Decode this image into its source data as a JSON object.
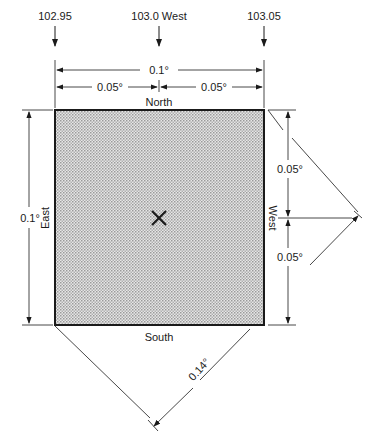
{
  "top_labels": {
    "left": "102.95",
    "center": "103.0 West",
    "right": "103.05"
  },
  "dimensions": {
    "top_total": "0.1°",
    "top_left_half": "0.05°",
    "top_right_half": "0.05°",
    "left_total": "0.1°",
    "right_upper_half": "0.05°",
    "right_lower_half": "0.05°",
    "diagonal": "0.14°"
  },
  "sides": {
    "north": "North",
    "south": "South",
    "east": "East",
    "west": "West"
  },
  "center_marker": "×",
  "colors": {
    "line": "#1a1a1a",
    "fill": "#d4d4d4"
  }
}
